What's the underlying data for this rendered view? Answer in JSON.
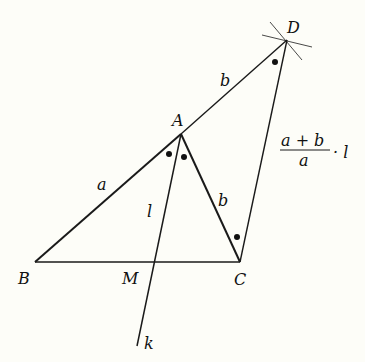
{
  "diagram": {
    "background": "#fdfdf8",
    "stroke_color": "#1a1a1a",
    "points": {
      "A": {
        "label": "A",
        "x": 181,
        "y": 134
      },
      "B": {
        "label": "B",
        "x": 35,
        "y": 262
      },
      "C": {
        "label": "C",
        "x": 240,
        "y": 262
      },
      "D": {
        "label": "D",
        "x": 287,
        "y": 40
      },
      "M": {
        "label": "M",
        "x": 154,
        "y": 262
      }
    },
    "line_labels": {
      "k": "k",
      "AB": "a",
      "AD": "b",
      "AC": "b",
      "AM": "l",
      "CD_num": "a + b",
      "CD_den": "a",
      "CD_mult": "· l"
    }
  }
}
